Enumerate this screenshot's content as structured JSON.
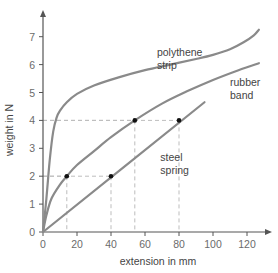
{
  "chart_data": {
    "type": "line",
    "title": "",
    "xlabel": "extension in mm",
    "ylabel": "weight in N",
    "xlim": [
      0,
      135
    ],
    "ylim": [
      0,
      7.7
    ],
    "xticks": [
      0,
      20,
      40,
      60,
      80,
      100,
      120
    ],
    "yticks": [
      0,
      1,
      2,
      3,
      4,
      5,
      6,
      7
    ],
    "grid": false,
    "legend": "none (inline curve labels)",
    "colors": {
      "curve": "#8a8a8a",
      "axis": "#555555",
      "guide": "#bdbdbd",
      "marker": "#111111"
    },
    "series": [
      {
        "name": "polythene strip",
        "label_lines": [
          "polythene",
          "strip"
        ],
        "label_pos": [
          67,
          6.3
        ],
        "x": [
          0,
          2,
          4,
          6,
          8,
          10,
          14,
          20,
          30,
          45,
          60,
          75,
          90,
          100,
          110,
          118,
          124,
          127
        ],
        "y": [
          0,
          1.2,
          2.6,
          3.6,
          4.1,
          4.35,
          4.65,
          4.95,
          5.25,
          5.55,
          5.8,
          6.0,
          6.2,
          6.35,
          6.55,
          6.8,
          7.05,
          7.25
        ]
      },
      {
        "name": "rubber band",
        "label_lines": [
          "rubber",
          "band"
        ],
        "label_pos": [
          110,
          5.25
        ],
        "x": [
          0,
          2,
          5,
          10,
          14,
          20,
          30,
          40,
          54,
          70,
          85,
          100,
          115,
          127
        ],
        "y": [
          0,
          0.6,
          1.2,
          1.7,
          2.0,
          2.4,
          2.9,
          3.4,
          4.0,
          4.6,
          5.05,
          5.45,
          5.8,
          6.05
        ]
      },
      {
        "name": "steel spring",
        "label_lines": [
          "steel",
          "spring"
        ],
        "label_pos": [
          69,
          2.55
        ],
        "x": [
          0,
          95
        ],
        "y": [
          0,
          4.65
        ]
      }
    ],
    "marked_points": [
      {
        "series": "rubber band",
        "x": 14,
        "y": 2
      },
      {
        "series": "rubber band",
        "x": 54,
        "y": 4
      },
      {
        "series": "steel spring",
        "x": 40,
        "y": 2
      },
      {
        "series": "steel spring",
        "x": 80,
        "y": 4
      }
    ],
    "guide_lines": [
      {
        "x": 14,
        "y": 2
      },
      {
        "x": 40,
        "y": 2
      },
      {
        "x": 54,
        "y": 4
      },
      {
        "x": 80,
        "y": 4
      }
    ]
  },
  "layout": {
    "origin_px": [
      43,
      232
    ],
    "px_per_x": 1.7,
    "px_per_y": 27.9,
    "x_axis_end_px": 272,
    "y_axis_top_px": 10
  }
}
